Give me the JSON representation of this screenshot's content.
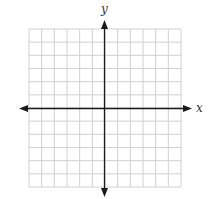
{
  "chart_data": {
    "type": "coordinate-grid",
    "title": "",
    "xlabel": "x",
    "ylabel": "y",
    "grid": true,
    "grid_cells_x": 12,
    "grid_cells_y": 12,
    "xlim": [
      -6,
      6
    ],
    "ylim": [
      -6,
      6
    ],
    "tick_labels": [],
    "series": []
  },
  "colors": {
    "grid": "#d0d0d0",
    "axis": "#1a1a1a",
    "label": "#333333"
  },
  "labels": {
    "x_axis": "x",
    "y_axis": "y"
  }
}
